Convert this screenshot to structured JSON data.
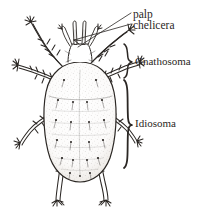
{
  "figure": {
    "view": "dorsal",
    "background_color": "#ffffff",
    "ink_color": "#2b2724",
    "text_color": "#2b2724"
  },
  "labels": {
    "palp": "palp",
    "chelicera": "chelicera",
    "gnathosoma": "Gnathosoma",
    "idiosoma": "Idiosoma"
  },
  "braces": {
    "gnathosoma": {
      "label": "Gnathosoma",
      "top": 44,
      "bottom": 78
    },
    "idiosoma": {
      "label": "Idiosoma",
      "top": 80,
      "bottom": 168
    }
  },
  "leaders": {
    "palp": {
      "from_x": 131,
      "from_y": 13,
      "to_x": 76,
      "to_y": 46
    },
    "chelicera": {
      "from_x": 131,
      "from_y": 24,
      "to_x": 71,
      "to_y": 43
    }
  },
  "anatomy": {
    "parts": [
      "palp",
      "chelicera",
      "gnathosoma",
      "idiosoma",
      "legs"
    ],
    "leg_pairs": 4
  }
}
